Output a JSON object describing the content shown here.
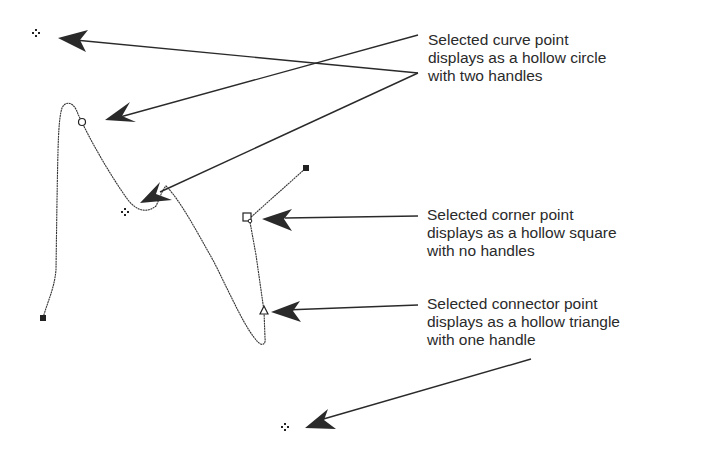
{
  "diagram": {
    "type": "bezier-path-point-types",
    "colors": {
      "background": "#ffffff",
      "ink": "#2a2a2a"
    }
  },
  "callouts": {
    "curve_point": {
      "lines": [
        "Selected curve point",
        "displays as a hollow circle",
        "with two handles"
      ]
    },
    "corner_point": {
      "lines": [
        "Selected corner point",
        "displays as a hollow square",
        "with no handles"
      ]
    },
    "connector_point": {
      "lines": [
        "Selected connector point",
        "displays as a hollow triangle",
        "with one handle"
      ]
    }
  },
  "points": [
    {
      "name": "start-anchor",
      "shape": "filled-square",
      "x": 43,
      "y": 318
    },
    {
      "name": "curve-point",
      "shape": "hollow-circle",
      "x": 82,
      "y": 122
    },
    {
      "name": "curve-handle-top",
      "shape": "handle-diamond",
      "x": 36,
      "y": 33
    },
    {
      "name": "curve-handle-bottom",
      "shape": "handle-diamond",
      "x": 125,
      "y": 212
    },
    {
      "name": "corner-point",
      "shape": "hollow-square",
      "x": 248,
      "y": 218
    },
    {
      "name": "end-anchor",
      "shape": "filled-square",
      "x": 306,
      "y": 168
    },
    {
      "name": "connector-point",
      "shape": "hollow-triangle",
      "x": 264,
      "y": 311
    },
    {
      "name": "connector-handle",
      "shape": "handle-diamond",
      "x": 285,
      "y": 427
    }
  ]
}
